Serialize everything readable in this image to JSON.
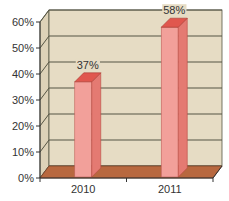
{
  "chart_data": {
    "type": "bar",
    "style": "3d-column",
    "title": "",
    "xlabel": "",
    "ylabel": "",
    "categories": [
      "2010",
      "2011"
    ],
    "values": [
      37,
      58
    ],
    "data_labels": [
      "37%",
      "58%"
    ],
    "ylim": [
      0,
      60
    ],
    "yticks": [
      0,
      10,
      20,
      30,
      40,
      50,
      60
    ],
    "ytick_labels": [
      "0%",
      "10%",
      "20%",
      "30%",
      "40%",
      "50%",
      "60%"
    ],
    "grid": true,
    "legend": "none",
    "colors": {
      "bar_front": "#f2a09a",
      "bar_top": "#e0574e",
      "bar_side": "#e47a72",
      "wall": "#e6dcc4",
      "floor": "#b8683f",
      "gridline": "#555544",
      "axis": "#333333"
    }
  }
}
